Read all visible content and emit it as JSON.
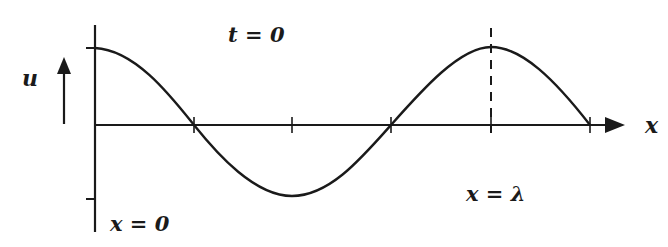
{
  "diagram": {
    "time_label": "t = 0",
    "y_axis_label": "u",
    "x_axis_label": "x",
    "origin_label": "x = 0",
    "wavelength_label": "x = λ",
    "colors": {
      "ink": "#1a1a1a",
      "background": "#ffffff"
    },
    "curve": {
      "type": "cosine",
      "description": "u = A cos(2πx/λ), from x = 0 to x = 5λ/4",
      "points": [
        {
          "x_fraction_lambda": 0,
          "u": 1
        },
        {
          "x_fraction_lambda": 0.25,
          "u": 0
        },
        {
          "x_fraction_lambda": 0.5,
          "u": -1
        },
        {
          "x_fraction_lambda": 0.75,
          "u": 0
        },
        {
          "x_fraction_lambda": 1,
          "u": 1
        },
        {
          "x_fraction_lambda": 1.25,
          "u": 0
        }
      ]
    },
    "ticks_x": [
      "λ/4",
      "λ/2",
      "3λ/4",
      "λ",
      "5λ/4"
    ],
    "ticks_u": [
      "A",
      "-A"
    ]
  }
}
